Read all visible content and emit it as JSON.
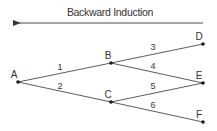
{
  "title": "Backward Induction",
  "arrow": {
    "direction": "right-to-left",
    "x1": 203,
    "x2": 18,
    "y": 23
  },
  "colors": {
    "line": "#4a4a4a",
    "node": "#1a1a1a",
    "text": "#333333"
  },
  "nodes": [
    {
      "id": "A",
      "label": "A",
      "x": 18,
      "y": 82,
      "lx": 14,
      "ly": 78
    },
    {
      "id": "B",
      "label": "B",
      "x": 111,
      "y": 63,
      "lx": 108,
      "ly": 59
    },
    {
      "id": "C",
      "label": "C",
      "x": 111,
      "y": 102,
      "lx": 108,
      "ly": 98
    },
    {
      "id": "D",
      "label": "D",
      "x": 203,
      "y": 44,
      "lx": 199,
      "ly": 40
    },
    {
      "id": "E",
      "label": "E",
      "x": 203,
      "y": 83,
      "lx": 199,
      "ly": 79
    },
    {
      "id": "F",
      "label": "F",
      "x": 203,
      "y": 122,
      "lx": 199,
      "ly": 118
    }
  ],
  "edges": [
    {
      "label": "1",
      "from": "A",
      "to": "B",
      "lx": 60,
      "ly": 70
    },
    {
      "label": "2",
      "from": "A",
      "to": "C",
      "lx": 60,
      "ly": 89
    },
    {
      "label": "3",
      "from": "B",
      "to": "D",
      "lx": 153,
      "ly": 50
    },
    {
      "label": "4",
      "from": "B",
      "to": "E",
      "lx": 153,
      "ly": 69
    },
    {
      "label": "5",
      "from": "C",
      "to": "E",
      "lx": 153,
      "ly": 89
    },
    {
      "label": "6",
      "from": "C",
      "to": "F",
      "lx": 153,
      "ly": 108
    }
  ]
}
